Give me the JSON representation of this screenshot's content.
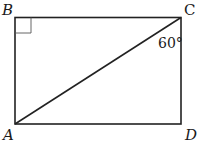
{
  "diagram": {
    "type": "geometry",
    "shape": "rectangle",
    "vertices": {
      "top_left": "B",
      "top_right": "C",
      "bottom_left": "A",
      "bottom_right": "D"
    },
    "diagonal": "AC",
    "right_angle_at": "B",
    "angle_label": "60°",
    "angle_at": "C",
    "angle_between": "BC-side diagonal AC and side CD"
  }
}
